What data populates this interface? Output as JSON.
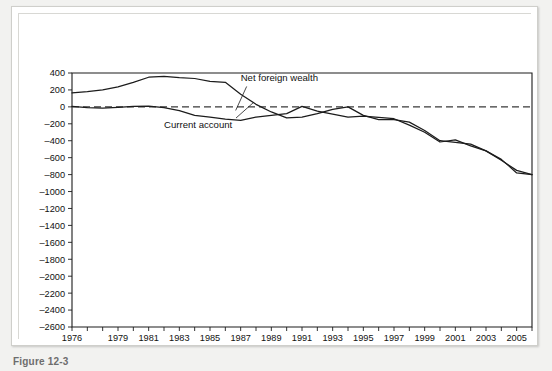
{
  "figure": {
    "axis_title": "Current account,\nnet foreign wealth (billions of dollars)",
    "caption": "Figure 12-3",
    "background_color": "#f2f2f0",
    "panel_color": "#ffffff",
    "line_color": "#1c1c1c"
  },
  "chart_data": {
    "type": "line",
    "title": "Current account, net foreign wealth (billions of dollars)",
    "xlabel": "",
    "ylabel": "billions of dollars",
    "xlim": [
      1976,
      2006
    ],
    "ylim": [
      -2600,
      400
    ],
    "ytick_step": 200,
    "grid": false,
    "legend": "inline-annotations",
    "zero_reference_line": 0,
    "x": [
      1976,
      1977,
      1978,
      1979,
      1980,
      1981,
      1982,
      1983,
      1984,
      1985,
      1986,
      1987,
      1988,
      1989,
      1990,
      1991,
      1992,
      1993,
      1994,
      1995,
      1996,
      1997,
      1998,
      1999,
      2000,
      2001,
      2002,
      2003,
      2004,
      2005,
      2006
    ],
    "xticks": [
      1976,
      1977,
      1978,
      1979,
      1980,
      1981,
      1982,
      1983,
      1984,
      1985,
      1986,
      1987,
      1988,
      1989,
      1990,
      1991,
      1992,
      1993,
      1994,
      1995,
      1996,
      1997,
      1998,
      1999,
      2000,
      2001,
      2002,
      2003,
      2004,
      2005,
      2006
    ],
    "xtick_labels": [
      "1976",
      "",
      "",
      "1979",
      "",
      "1981",
      "",
      "1983",
      "",
      "1985",
      "",
      "1987",
      "",
      "1989",
      "",
      "1991",
      "",
      "1993",
      "",
      "1995",
      "",
      "1997",
      "",
      "1999",
      "",
      "2001",
      "",
      "2003",
      "",
      "2005",
      ""
    ],
    "yticks": [
      400,
      200,
      0,
      -200,
      -400,
      -600,
      -800,
      -1000,
      -1200,
      -1400,
      -1600,
      -1800,
      -2000,
      -2200,
      -2400,
      -2600
    ],
    "ytick_labels": [
      "400",
      "200",
      "0",
      "-200",
      "-400",
      "-600",
      "-800",
      "-1000",
      "-1200",
      "-1400",
      "-1600",
      "-1800",
      "-2000",
      "-2200",
      "-2400",
      "-2600"
    ],
    "series": [
      {
        "name": "Net foreign wealth",
        "label_text": "Net foreign wealth",
        "values": [
          165,
          180,
          200,
          235,
          290,
          350,
          360,
          345,
          335,
          300,
          290,
          150,
          30,
          -60,
          -130,
          -120,
          -80,
          -30,
          0,
          -100,
          -150,
          -150,
          -180,
          -280,
          -400,
          -420,
          -440,
          -520,
          -620,
          -780,
          -800
        ]
      },
      {
        "name": "Current account",
        "label_text": "Current account",
        "values": [
          5,
          -10,
          -15,
          -5,
          5,
          8,
          -8,
          -45,
          -100,
          -120,
          -145,
          -160,
          -120,
          -100,
          -80,
          5,
          -50,
          -85,
          -122,
          -110,
          -125,
          -140,
          -215,
          -300,
          -415,
          -390,
          -460,
          -520,
          -630,
          -750,
          -800
        ]
      }
    ],
    "annotations": [
      {
        "text": "Net foreign wealth",
        "x": 1987,
        "y": 300
      },
      {
        "text": "Current account",
        "x": 1982,
        "y": -250
      }
    ]
  }
}
